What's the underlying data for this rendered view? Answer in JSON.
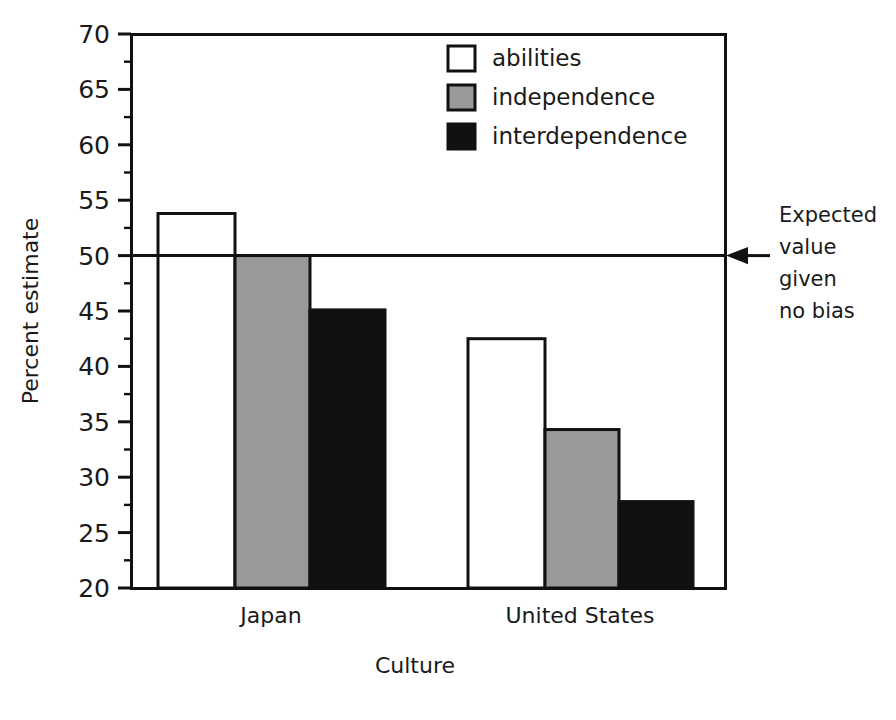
{
  "chart_data": {
    "type": "bar",
    "title": "",
    "subtitle": "",
    "xlabel": "Culture",
    "ylabel": "Percent estimate",
    "categories": [
      "Japan",
      "United States"
    ],
    "series": [
      {
        "name": "abilities",
        "color": "#ffffff",
        "values": [
          53.8,
          42.5
        ]
      },
      {
        "name": "independence",
        "color": "#999999",
        "values": [
          50.0,
          34.3
        ]
      },
      {
        "name": "interdependence",
        "color": "#111111",
        "values": [
          45.1,
          27.8
        ]
      }
    ],
    "ylim": [
      20,
      70
    ],
    "ytick_labels": [
      "70",
      "65",
      "60",
      "55",
      "50",
      "45",
      "40",
      "35",
      "30",
      "25",
      "20"
    ],
    "ytick_values": [
      70,
      65,
      60,
      55,
      50,
      45,
      40,
      35,
      30,
      25,
      20
    ],
    "yminor_values": [
      67.5,
      62.5,
      57.5,
      52.5,
      47.5,
      42.5,
      37.5,
      32.5,
      27.5,
      22.5
    ],
    "grid": false,
    "legend_position": "top-center",
    "legend_entries": [
      "abilities",
      "independence",
      "interdependence"
    ],
    "annotations": [
      {
        "name": "expected-value-annotation",
        "lines": [
          "Expected",
          "value",
          "given",
          "no bias"
        ],
        "target_value": 50,
        "arrow": "left"
      }
    ],
    "reference_line": {
      "value": 50,
      "label": "Expected value given no bias"
    }
  },
  "axis": {
    "y_title": "Percent estimate",
    "x_title": "Culture"
  },
  "annotation": {
    "line1": "Expected",
    "line2": "value",
    "line3": "given",
    "line4": "no bias"
  }
}
